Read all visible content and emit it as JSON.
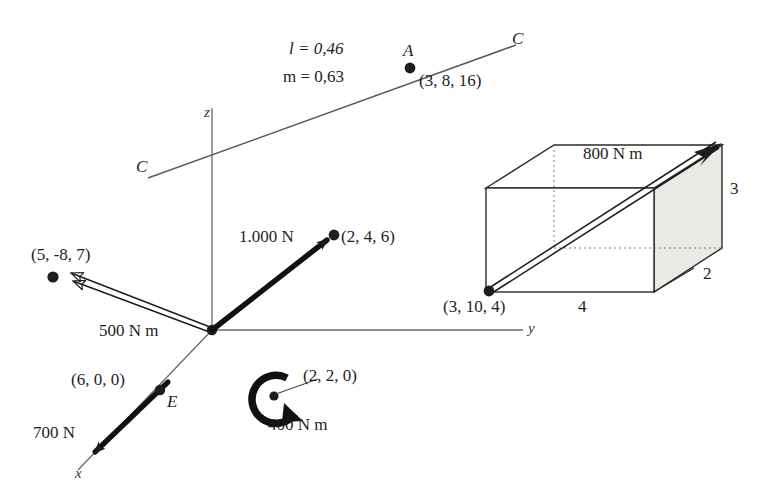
{
  "figure": {
    "background_color": "#ffffff",
    "ink_color": "#1d1d1d"
  },
  "axes": {
    "origin_label": "",
    "x_label": "x",
    "y_label": "y",
    "z_label": "z"
  },
  "line_cc": {
    "near_label": "C",
    "far_label": "C",
    "point_label": "A",
    "point_coords": "(3, 8, 16)",
    "direction_cosine_l": "l = 0,46",
    "direction_cosine_m": "m = 0,63"
  },
  "vectors": {
    "force_1000": {
      "magnitude_label": "1.000 N",
      "tip_coords": "(2, 4, 6)",
      "kind": "force"
    },
    "force_700": {
      "magnitude_label": "700 N",
      "point_label": "E",
      "point_coords": "(6, 0, 0)",
      "kind": "force"
    },
    "moment_500": {
      "magnitude_label": "500 N m",
      "tip_coords": "(5, -8, 7)",
      "kind": "moment"
    },
    "moment_400": {
      "magnitude_label": "400 N m",
      "point_coords": "(2, 2, 0)",
      "kind": "couple-curl"
    },
    "moment_800": {
      "magnitude_label": "800 N m",
      "base_coords": "(3, 10, 4)",
      "kind": "moment"
    }
  },
  "box": {
    "dim_width": "4",
    "dim_depth": "2",
    "dim_height": "3",
    "face_fill": "#e8e8e4"
  }
}
